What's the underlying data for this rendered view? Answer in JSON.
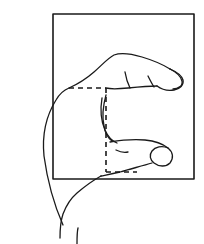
{
  "figure": {
    "title": "Hand measuring a rectangular object",
    "caption": "Line drawing of a hand in side view with index finger and thumb spanning a rectangle; dashed lines mark the measured span.",
    "background_color": "#ffffff",
    "ink_color": "#1a1a1a",
    "canvas": {
      "width": 204,
      "height": 244
    }
  },
  "rectangle": {
    "label": "Rectangle outline",
    "x": 53,
    "y": 14,
    "width": 141,
    "height": 165,
    "stroke_width": 1.6,
    "stroke_color": "#1a1a1a",
    "fill": "none"
  },
  "measurement": {
    "label": "Dashed measurement guides",
    "stroke_width": 1.6,
    "stroke_color": "#1a1a1a",
    "dash_pattern": "5,4",
    "top_line": {
      "label": "Top dashed guide",
      "x1": 69,
      "y1": 88,
      "x2": 106,
      "y2": 88
    },
    "vertical_line": {
      "label": "Vertical dashed guide",
      "x1": 106,
      "y1": 88,
      "x2": 106,
      "y2": 172
    },
    "bottom_line": {
      "label": "Bottom dashed guide",
      "x1": 106,
      "y1": 172,
      "x2": 137,
      "y2": 172
    }
  },
  "hand": {
    "label": "Hand outline",
    "stroke_width": 1.3,
    "stroke_color": "#1a1a1a",
    "parts": [
      {
        "name": "forearm-upper-edge",
        "label": "Upper forearm and wrist contour",
        "path": "M 63 225 C 52 200 47 178 44 156 C 42 136 46 116 56 100 C 60 93 64 90 69 88"
      },
      {
        "name": "index-finger-top",
        "label": "Index finger upper contour",
        "path": "M 69 88 C 78 84 86 79 94 72 C 102 65 108 58 114 55 C 122 52 132 54 142 57 C 152 60 162 64 170 69"
      },
      {
        "name": "index-fingertip",
        "label": "Index fingertip contour",
        "path": "M 170 69 C 177 72 182 76 183 80 C 184 85 180 89 174 90 C 168 91 161 89 157 86"
      },
      {
        "name": "index-finger-underside",
        "label": "Index finger underside and palm crease",
        "path": "M 157 86 C 148 86 138 87 128 88 C 118 89 110 89 106 88"
      },
      {
        "name": "index-nail",
        "label": "Index fingernail outline",
        "path": "M 170 69 C 176 72 181 77 182 81 C 183 86 178 89 173 89"
      },
      {
        "name": "index-knuckle-crease-1",
        "label": "Index finger knuckle crease",
        "path": "M 125 72 C 126 78 128 84 130 88"
      },
      {
        "name": "index-knuckle-crease-2",
        "label": "Index finger second knuckle crease",
        "path": "M 148 76 C 150 80 152 84 154 87"
      },
      {
        "name": "middle-finger-fold",
        "label": "Folded middle finger line",
        "path": "M 106 95 C 103 106 102 117 104 126 C 105 133 108 138 112 141"
      },
      {
        "name": "middle-finger-fold-inner",
        "label": "Folded finger inner line",
        "path": "M 102 98 C 100 110 101 121 105 130 C 108 137 112 141 117 143"
      },
      {
        "name": "thumb-top",
        "label": "Thumb upper contour",
        "path": "M 110 142 C 122 140 134 139 145 140 C 155 141 163 144 168 148"
      },
      {
        "name": "thumb-tip",
        "label": "Thumb tip contour",
        "path": "M 168 148 C 173 152 174 158 170 163 C 166 167 159 167 154 163 C 150 160 149 155 152 151 C 155 147 162 145 168 148"
      },
      {
        "name": "thumb-underside",
        "label": "Thumb underside contour",
        "path": "M 152 163 C 142 166 130 169 120 172 C 112 174 106 175 101 176"
      },
      {
        "name": "thumb-base-crease",
        "label": "Thumb base crease",
        "path": "M 116 150 C 120 152 124 153 128 152"
      },
      {
        "name": "palm-lower-edge",
        "label": "Lower palm and wrist contour",
        "path": "M 101 176 C 92 181 84 187 77 193 C 70 199 66 206 63 214 C 61 220 60 228 60 238"
      },
      {
        "name": "wrist-right-edge",
        "label": "Right wrist edge",
        "path": "M 77 244 C 77 238 77 232 78 228"
      }
    ]
  }
}
